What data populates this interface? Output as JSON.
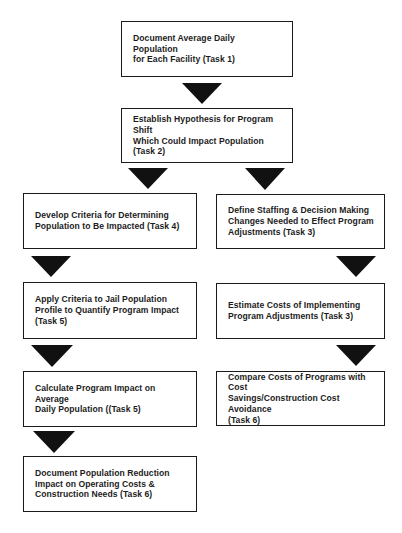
{
  "diagram": {
    "type": "flowchart",
    "colors": {
      "box_border": "#1a1a1a",
      "arrow_fill": "#111111",
      "text": "#1c1c1c",
      "background": "#ffffff"
    },
    "boxes": [
      {
        "id": "task1-document-adp",
        "text": "Document Average Daily Population\nfor Each Facility  (Task 1)",
        "x": 121,
        "y": 21,
        "w": 172,
        "h": 56
      },
      {
        "id": "task2-hypothesis",
        "text": "Establish Hypothesis for Program Shift\nWhich Could Impact Population\n(Task  2)",
        "x": 121,
        "y": 108,
        "w": 172,
        "h": 55
      },
      {
        "id": "task4-develop-criteria",
        "text": "Develop Criteria for Determining\nPopulation to Be Impacted  (Task 4)",
        "x": 23,
        "y": 193,
        "w": 174,
        "h": 56
      },
      {
        "id": "task3-define-staffing",
        "text": "Define Staffing & Decision Making\nChanges Needed to Effect Program\nAdjustments  (Task 3)",
        "x": 216,
        "y": 194,
        "w": 169,
        "h": 55
      },
      {
        "id": "task5-apply-criteria",
        "text": "Apply Criteria to Jail Population\nProfile to Quantify Program Impact\n(Task 5)",
        "x": 23,
        "y": 282,
        "w": 174,
        "h": 57
      },
      {
        "id": "task3-estimate-costs",
        "text": "Estimate Costs of Implementing\nProgram Adjustments  (Task 3)",
        "x": 216,
        "y": 283,
        "w": 169,
        "h": 56
      },
      {
        "id": "task5-calculate-impact",
        "text": "Calculate Program Impact on Average\nDaily Population  ((Task 5)",
        "x": 23,
        "y": 371,
        "w": 174,
        "h": 56
      },
      {
        "id": "task6-compare-costs",
        "text": "Compare Costs of Programs with Cost\nSavings/Construction Cost Avoidance\n(Task 6)",
        "x": 216,
        "y": 371,
        "w": 169,
        "h": 55
      },
      {
        "id": "task6-document-reduction",
        "text": "Document Population Reduction\nImpact on Operating Costs &\nConstruction Needs  (Task 6)",
        "x": 23,
        "y": 456,
        "w": 174,
        "h": 56
      }
    ],
    "arrows": [
      {
        "id": "arrow-task1-to-task2",
        "from": "task1-document-adp",
        "to": "task2-hypothesis",
        "x": 182,
        "y": 83,
        "w": 41,
        "h": 21
      },
      {
        "id": "arrow-task2-to-task4",
        "from": "task2-hypothesis",
        "to": "task4-develop-criteria",
        "x": 128,
        "y": 168,
        "w": 41,
        "h": 21
      },
      {
        "id": "arrow-task2-to-task3",
        "from": "task2-hypothesis",
        "to": "task3-define-staffing",
        "x": 245,
        "y": 168,
        "w": 41,
        "h": 22
      },
      {
        "id": "arrow-task4-to-task5",
        "from": "task4-develop-criteria",
        "to": "task5-apply-criteria",
        "x": 31,
        "y": 256,
        "w": 41,
        "h": 21
      },
      {
        "id": "arrow-task3-to-estimate",
        "from": "task3-define-staffing",
        "to": "task3-estimate-costs",
        "x": 336,
        "y": 256,
        "w": 41,
        "h": 21
      },
      {
        "id": "arrow-task5-to-calculate",
        "from": "task5-apply-criteria",
        "to": "task5-calculate-impact",
        "x": 31,
        "y": 345,
        "w": 42,
        "h": 22
      },
      {
        "id": "arrow-estimate-to-compare",
        "from": "task3-estimate-costs",
        "to": "task6-compare-costs",
        "x": 336,
        "y": 345,
        "w": 41,
        "h": 21
      },
      {
        "id": "arrow-calculate-to-document",
        "from": "task5-calculate-impact",
        "to": "task6-document-reduction",
        "x": 33,
        "y": 431,
        "w": 42,
        "h": 22
      }
    ]
  }
}
